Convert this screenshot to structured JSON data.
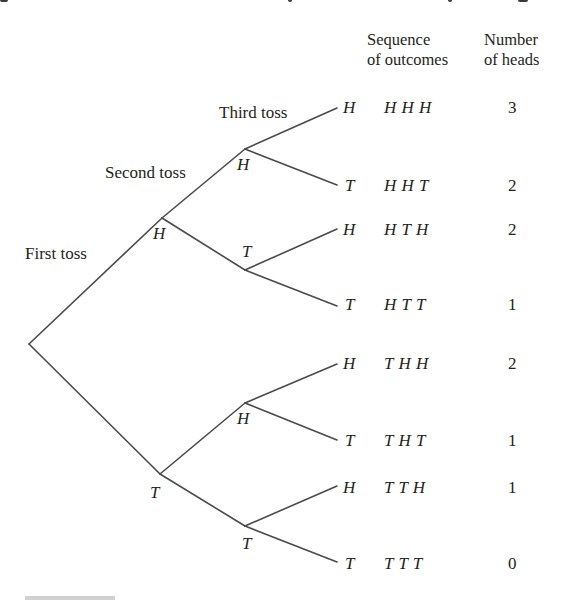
{
  "headers": {
    "sequence_line1": "Sequence",
    "sequence_line2": "of outcomes",
    "number_line1": "Number",
    "number_line2": "of heads"
  },
  "level_labels": {
    "first": "First toss",
    "second": "Second toss",
    "third": "Third toss"
  },
  "nodes": {
    "first_H": "H",
    "first_T": "T",
    "second_HH": "H",
    "second_HT": "T",
    "second_TH": "H",
    "second_TT": "T"
  },
  "leaves": [
    {
      "toss": "H",
      "sequence": "H H H",
      "heads": "3"
    },
    {
      "toss": "T",
      "sequence": "H H T",
      "heads": "2"
    },
    {
      "toss": "H",
      "sequence": "H T H",
      "heads": "2"
    },
    {
      "toss": "T",
      "sequence": "H T T",
      "heads": "1"
    },
    {
      "toss": "H",
      "sequence": "T H H",
      "heads": "2"
    },
    {
      "toss": "T",
      "sequence": "T H T",
      "heads": "1"
    },
    {
      "toss": "H",
      "sequence": "T T H",
      "heads": "1"
    },
    {
      "toss": "T",
      "sequence": "T T T",
      "heads": "0"
    }
  ],
  "colors": {
    "line": "#4a4a4a",
    "text": "#231f20"
  }
}
